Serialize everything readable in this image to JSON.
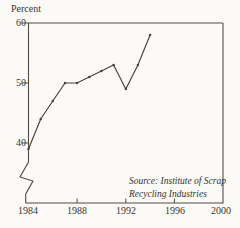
{
  "figure": {
    "y_axis_label": "Percent",
    "source_line1": "Source: Institute of Scrap",
    "source_line2": "Recycling Industries"
  },
  "chart_data": {
    "type": "line",
    "title": "",
    "xlabel": "",
    "ylabel": "Percent",
    "x": [
      1984,
      1985,
      1986,
      1987,
      1988,
      1989,
      1990,
      1991,
      1992,
      1993,
      1994
    ],
    "values": [
      39,
      44,
      47,
      50,
      50,
      51,
      52,
      53,
      49,
      53,
      58
    ],
    "series": [
      {
        "name": "Percent",
        "values": [
          39,
          44,
          47,
          50,
          50,
          51,
          52,
          53,
          49,
          53,
          58
        ]
      }
    ],
    "x_ticks": [
      "1984",
      "1988",
      "1992",
      "1996",
      "2000"
    ],
    "y_ticks": [
      "60",
      "50",
      "40"
    ],
    "xlim": [
      1984,
      2000
    ],
    "ylim": [
      40,
      60
    ],
    "y_axis_break": true,
    "grid": false,
    "legend_position": "none",
    "line_color": "#44413b",
    "axis_color": "#504d46",
    "annotation": "Source: Institute of Scrap Recycling Industries"
  }
}
